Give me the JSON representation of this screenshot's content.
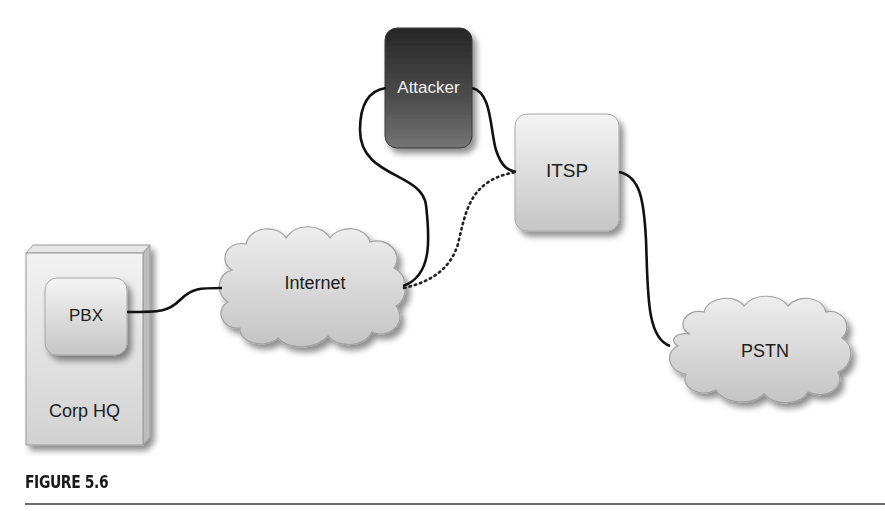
{
  "figure": {
    "caption": "FIGURE 5.6"
  },
  "nodes": {
    "corp_hq": {
      "label": "Corp HQ",
      "type": "building"
    },
    "pbx": {
      "label": "PBX",
      "type": "device"
    },
    "internet": {
      "label": "Internet",
      "type": "cloud"
    },
    "attacker": {
      "label": "Attacker",
      "type": "device"
    },
    "itsp": {
      "label": "ITSP",
      "type": "device"
    },
    "pstn": {
      "label": "PSTN",
      "type": "cloud"
    }
  },
  "edges": [
    {
      "from": "PBX",
      "to": "Internet",
      "style": "solid"
    },
    {
      "from": "Internet",
      "to": "Attacker",
      "style": "solid"
    },
    {
      "from": "Attacker",
      "to": "ITSP",
      "style": "solid"
    },
    {
      "from": "Internet",
      "to": "ITSP",
      "style": "dotted"
    },
    {
      "from": "ITSP",
      "to": "PSTN",
      "style": "solid"
    }
  ],
  "colors": {
    "attacker_fill_top": "#2e2e2e",
    "attacker_fill_bottom": "#6e6e6e",
    "box_fill": "#dcdcdc",
    "cloud_fill": "#d4d4d4",
    "line": "#111111"
  }
}
